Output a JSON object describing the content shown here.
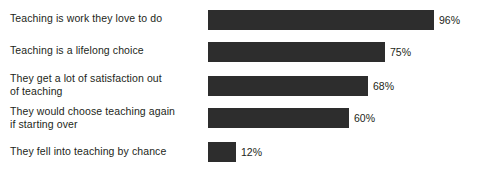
{
  "chart_data": {
    "type": "bar",
    "orientation": "horizontal",
    "title": "",
    "xlabel": "",
    "ylabel": "",
    "xlim": [
      0,
      100
    ],
    "grid": false,
    "legend": false,
    "value_suffix": "%",
    "bar_color": "#2d2d2d",
    "background_color": "#ffffff",
    "text_color": "#231f20",
    "categories": [
      "Teaching is work they love to do",
      "Teaching is a lifelong choice",
      "They get a lot of satisfaction out\nof teaching",
      "They would choose teaching again\nif starting over",
      "They fell into teaching by chance"
    ],
    "values": [
      96,
      75,
      68,
      60,
      12
    ],
    "value_labels": [
      "96%",
      "75%",
      "68%",
      "60%",
      "12%"
    ],
    "bars": [
      {
        "category": "Teaching is work they love to do",
        "value": 96,
        "value_label": "96%",
        "label_top": 12,
        "bar_top": 10
      },
      {
        "category": "Teaching is a lifelong choice",
        "value": 75,
        "value_label": "75%",
        "label_top": 44,
        "bar_top": 42
      },
      {
        "category": "They get a lot of satisfaction out\nof teaching",
        "value": 68,
        "value_label": "68%",
        "label_top": 72,
        "bar_top": 76
      },
      {
        "category": "They would choose teaching again\nif starting over",
        "value": 60,
        "value_label": "60%",
        "label_top": 105,
        "bar_top": 108
      },
      {
        "category": "They fell into teaching by chance",
        "value": 12,
        "value_label": "12%",
        "label_top": 145,
        "bar_top": 142
      }
    ]
  }
}
